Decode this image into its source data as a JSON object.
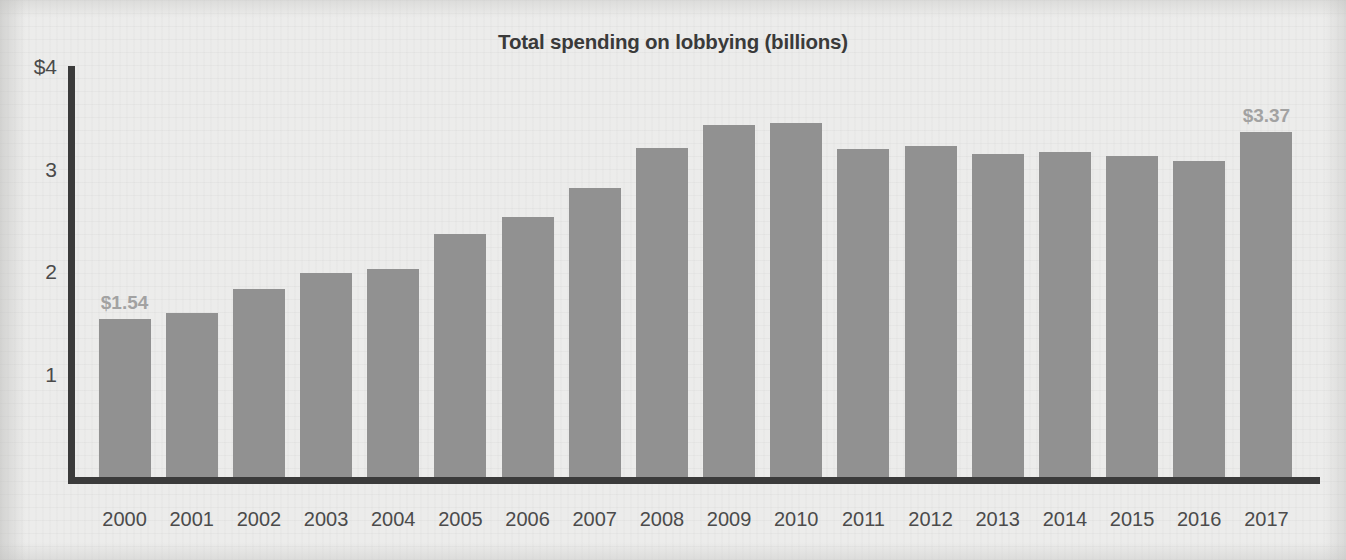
{
  "chart_data": {
    "type": "bar",
    "title": "Total spending on lobbying (billions)",
    "subtitle": "",
    "xlabel": "",
    "ylabel": "",
    "categories": [
      "2000",
      "2001",
      "2002",
      "2003",
      "2004",
      "2005",
      "2006",
      "2007",
      "2008",
      "2009",
      "2010",
      "2011",
      "2012",
      "2013",
      "2014",
      "2015",
      "2016",
      "2017"
    ],
    "values": [
      1.54,
      1.6,
      1.83,
      1.99,
      2.03,
      2.37,
      2.54,
      2.82,
      3.21,
      3.43,
      3.45,
      3.2,
      3.23,
      3.15,
      3.17,
      3.13,
      3.08,
      3.37
    ],
    "value_labels": [
      {
        "category": "2000",
        "text": "$1.54"
      },
      {
        "category": "2017",
        "text": "$3.37"
      }
    ],
    "ylim": [
      0,
      4
    ],
    "yticks": [
      1,
      2,
      3,
      4
    ],
    "ytick_labels": [
      "1",
      "2",
      "3",
      "$4"
    ],
    "grid": false,
    "legend": null,
    "bar_color": "#919191",
    "axis_color": "#3b3b3b",
    "label_color": "#a2a2a2",
    "title_color": "#3a3a3a",
    "background_color": "#ececeb"
  }
}
